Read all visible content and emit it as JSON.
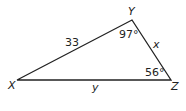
{
  "diagram": {
    "type": "triangle",
    "vertices": {
      "X": {
        "label": "X"
      },
      "Y": {
        "label": "Y"
      },
      "Z": {
        "label": "Z"
      }
    },
    "sides": {
      "XY": {
        "label": "33"
      },
      "YZ": {
        "label": "x"
      },
      "XZ": {
        "label": "y"
      }
    },
    "angles": {
      "Y": {
        "label": "97°"
      },
      "Z": {
        "label": "56°"
      }
    },
    "colors": {
      "stroke": "#222222",
      "background": "#ffffff"
    }
  }
}
